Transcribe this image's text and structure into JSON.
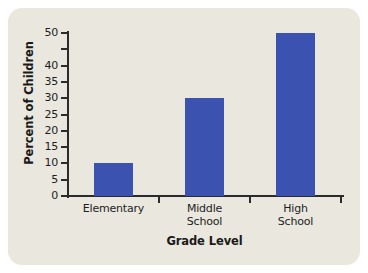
{
  "chart_data": {
    "type": "bar",
    "title": "",
    "subtitle": "",
    "categories": [
      "Elementary",
      "Middle School",
      "High School"
    ],
    "values": [
      10,
      30,
      50
    ],
    "xlabel": "Grade Level",
    "ylabel": "Percent of Children",
    "ylim": [
      0,
      50
    ],
    "yticks": [
      0,
      5,
      10,
      15,
      20,
      25,
      30,
      35,
      40,
      45,
      50
    ],
    "ytick_labels": [
      "0",
      "5",
      "10",
      "15",
      "20",
      "25",
      "30",
      "35",
      "40",
      "",
      "50"
    ],
    "grid": false,
    "legend": null,
    "series": [
      {
        "name": "Percent of Children",
        "values": [
          10,
          30,
          50
        ]
      }
    ],
    "annotations": []
  },
  "style": {
    "bar_color": "#3b52b0",
    "panel_background": "#e9e7de",
    "page_background": "#ffffff",
    "axis_color": "#2b2b2b",
    "text_color": "#1e1e1e"
  },
  "axis": {
    "y_title": "Percent of Children",
    "x_title": "Grade Level"
  },
  "categories_display": [
    {
      "line1": "Elementary",
      "line2": ""
    },
    {
      "line1": "Middle",
      "line2": "School"
    },
    {
      "line1": "High",
      "line2": "School"
    }
  ]
}
